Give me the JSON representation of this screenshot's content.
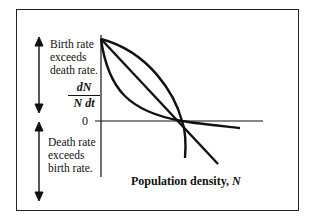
{
  "diagram": {
    "upper_label": [
      "Birth rate",
      "exceeds",
      "death rate."
    ],
    "lower_label": [
      "Death rate",
      "exceeds",
      "birth rate."
    ],
    "y_axis_label": {
      "numerator": "dN",
      "denominator": "N dt"
    },
    "zero_tick": "0",
    "x_axis_label": "Population density,",
    "x_axis_variable": "N",
    "curves": [
      {
        "name": "convex-curve",
        "description": "bows upward, crosses zero then flattens"
      },
      {
        "name": "linear",
        "description": "straight line declining"
      },
      {
        "name": "concave-curve",
        "description": "bows downward, crosses zero then drops steeply"
      }
    ],
    "line_color": "#111111"
  }
}
